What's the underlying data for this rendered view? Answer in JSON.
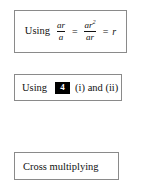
{
  "page": {
    "kind": "math-working-steps",
    "background_color": "#ffffff",
    "border_color": "#8a8a8a",
    "text_color": "#111111"
  },
  "steps": [
    {
      "id": "step-fraction-identity",
      "lead_word": "Using",
      "expression": {
        "fraction_1": {
          "numerator": "ar",
          "denominator": "a"
        },
        "relation_1": "=",
        "fraction_2": {
          "numerator_base": "ar",
          "numerator_exponent": "2",
          "denominator": "ar"
        },
        "relation_2": "=",
        "result": "r"
      },
      "plain_text": "Using ar/a = ar^2/ar = r"
    },
    {
      "id": "step-reference",
      "lead_word": "Using",
      "reference_number": "4",
      "reference_chip_background": "#000000",
      "reference_chip_text_color": "#ffffff",
      "trailing_text": "(i) and (ii)",
      "plain_text": "Using 4 (i) and (ii)"
    },
    {
      "id": "step-cross-multiplying",
      "label": "Cross multiplying",
      "plain_text": "Cross multiplying"
    }
  ]
}
